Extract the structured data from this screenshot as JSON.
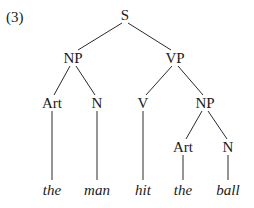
{
  "example_number": "(3)",
  "tree": {
    "nodes": [
      {
        "id": "S",
        "label": "S",
        "x": 125,
        "y": 15
      },
      {
        "id": "NP1",
        "label": "NP",
        "x": 73,
        "y": 58
      },
      {
        "id": "VP",
        "label": "VP",
        "x": 175,
        "y": 58
      },
      {
        "id": "Art1",
        "label": "Art",
        "x": 52,
        "y": 103
      },
      {
        "id": "N1",
        "label": "N",
        "x": 97,
        "y": 103
      },
      {
        "id": "V",
        "label": "V",
        "x": 143,
        "y": 103
      },
      {
        "id": "NP2",
        "label": "NP",
        "x": 205,
        "y": 103
      },
      {
        "id": "Art2",
        "label": "Art",
        "x": 183,
        "y": 147
      },
      {
        "id": "N2",
        "label": "N",
        "x": 228,
        "y": 147
      }
    ],
    "leaves": [
      {
        "id": "w1",
        "label": "the",
        "x": 52,
        "y": 190
      },
      {
        "id": "w2",
        "label": "man",
        "x": 97,
        "y": 190
      },
      {
        "id": "w3",
        "label": "hit",
        "x": 143,
        "y": 190
      },
      {
        "id": "w4",
        "label": "the",
        "x": 183,
        "y": 190
      },
      {
        "id": "w5",
        "label": "ball",
        "x": 228,
        "y": 190
      }
    ],
    "edges": [
      [
        "S",
        "NP1"
      ],
      [
        "S",
        "VP"
      ],
      [
        "NP1",
        "Art1"
      ],
      [
        "NP1",
        "N1"
      ],
      [
        "VP",
        "V"
      ],
      [
        "VP",
        "NP2"
      ],
      [
        "NP2",
        "Art2"
      ],
      [
        "NP2",
        "N2"
      ],
      [
        "Art1",
        "w1"
      ],
      [
        "N1",
        "w2"
      ],
      [
        "V",
        "w3"
      ],
      [
        "Art2",
        "w4"
      ],
      [
        "N2",
        "w5"
      ]
    ]
  }
}
